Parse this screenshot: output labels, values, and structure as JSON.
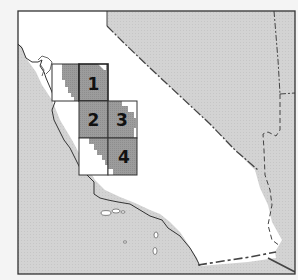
{
  "map": {
    "title": "California study area grid",
    "colors": {
      "background": "#f4f4f4",
      "ocean_neighbor": "#d6d6d6",
      "land": "#ffffff",
      "cell_fill": "#9a9a9a",
      "border": "#333333"
    },
    "cells": [
      {
        "id": "1",
        "label": "1"
      },
      {
        "id": "2",
        "label": "2"
      },
      {
        "id": "3",
        "label": "3"
      },
      {
        "id": "4",
        "label": "4"
      }
    ]
  }
}
